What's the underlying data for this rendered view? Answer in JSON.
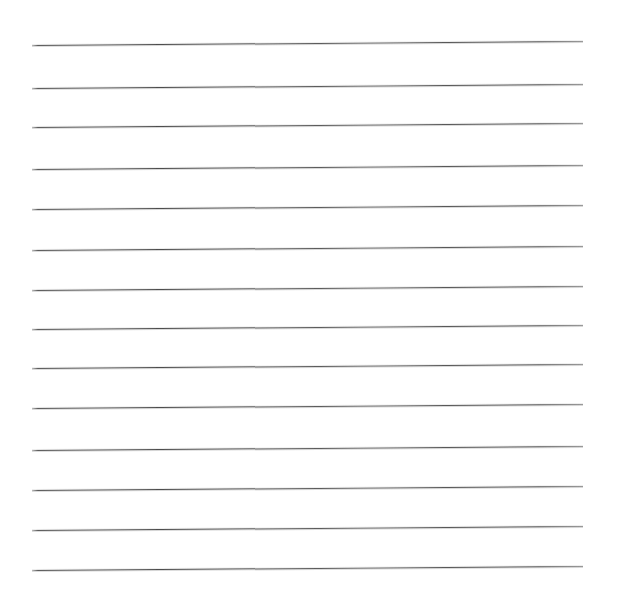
{
  "canvas": {
    "width": 617,
    "height": 614,
    "background_color": "#ffffff",
    "description": "Blank ruled sheet with horizontal lines"
  },
  "ruled_sheet": {
    "line_color": "#4a4a4a",
    "line_thickness_px": 1,
    "line_count": 14,
    "left_x": 32,
    "right_x": 583,
    "line_length_px": 551,
    "vertical_spacing_px": 40.4,
    "slant_rise_px": 4,
    "margin_left_px": 32,
    "margin_right_px": 34,
    "margin_top_px": 45,
    "margin_bottom_px": 44,
    "lines": [
      {
        "index": 1,
        "left_y": 45,
        "right_y": 41
      },
      {
        "index": 2,
        "left_y": 88,
        "right_y": 84
      },
      {
        "index": 3,
        "left_y": 127,
        "right_y": 123
      },
      {
        "index": 4,
        "left_y": 169,
        "right_y": 165
      },
      {
        "index": 5,
        "left_y": 209,
        "right_y": 205
      },
      {
        "index": 6,
        "left_y": 250,
        "right_y": 246
      },
      {
        "index": 7,
        "left_y": 290,
        "right_y": 286
      },
      {
        "index": 8,
        "left_y": 329,
        "right_y": 325
      },
      {
        "index": 9,
        "left_y": 368,
        "right_y": 364
      },
      {
        "index": 10,
        "left_y": 408,
        "right_y": 404
      },
      {
        "index": 11,
        "left_y": 450,
        "right_y": 446
      },
      {
        "index": 12,
        "left_y": 490,
        "right_y": 486
      },
      {
        "index": 13,
        "left_y": 530,
        "right_y": 526
      },
      {
        "index": 14,
        "left_y": 570,
        "right_y": 566
      }
    ]
  }
}
